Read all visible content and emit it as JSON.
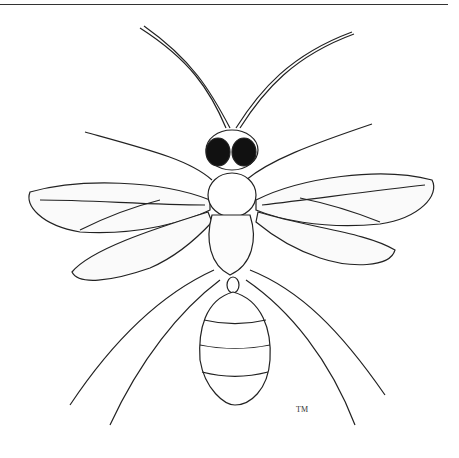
{
  "illustration": {
    "subject": "winged ant (dorsal view)",
    "style": "black-and-white stippled line drawing",
    "signature": "TM"
  }
}
